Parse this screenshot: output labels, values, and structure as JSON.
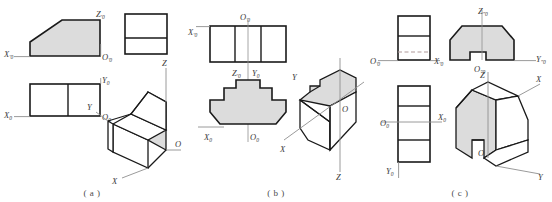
{
  "figure": {
    "type": "engineering-drawing",
    "colors": {
      "face_shading": "#dcdcdc",
      "outline": "#1a1a1a",
      "axis_line": "#9a9a9a",
      "hidden_line": "#b0a0a0",
      "background": "#ffffff",
      "label_text": "#3a3a3a"
    }
  },
  "panels": [
    {
      "id": "a",
      "caption": "( a )",
      "labels": {
        "front_x": "X",
        "front_x_marks": "'0",
        "front_z": "Z",
        "front_z_marks": "'0",
        "front_o": "O",
        "front_o_marks": "'0",
        "top_x": "X",
        "top_x_marks": "0",
        "top_y": "Y",
        "top_y_marks": "0",
        "top_o": "O",
        "top_o_marks": "0",
        "iso_x": "X",
        "iso_y": "Y",
        "iso_z": "Z",
        "iso_o": "O"
      }
    },
    {
      "id": "b",
      "caption": "( b )",
      "labels": {
        "top_x": "X",
        "top_x_marks": "'0",
        "top_o": "O",
        "top_o_marks": "'0",
        "front_z": "Z",
        "front_z_marks": "'0",
        "front_y": "Y",
        "front_y_marks": "0",
        "front_x": "X",
        "front_x_marks": "0",
        "front_o": "O",
        "front_o_marks": "0",
        "iso_x": "X",
        "iso_y": "Y",
        "iso_z": "Z",
        "iso_o": "O"
      }
    },
    {
      "id": "c",
      "caption": "( c )",
      "labels": {
        "left_o": "O",
        "left_o_marks": "'0",
        "left_x": "X",
        "left_x_marks": "'0",
        "front_z": "Z",
        "front_z_marks": "\"0",
        "front_y": "Y",
        "front_y_marks": "\"0",
        "front_o": "O",
        "front_o_marks": "\"0",
        "top_o": "O",
        "top_o_marks": "0",
        "top_x": "X",
        "top_x_marks": "0",
        "top_y": "Y",
        "top_y_marks": "0",
        "iso_x": "X",
        "iso_y": "Y",
        "iso_z": "Z",
        "iso_o": "O"
      }
    }
  ]
}
